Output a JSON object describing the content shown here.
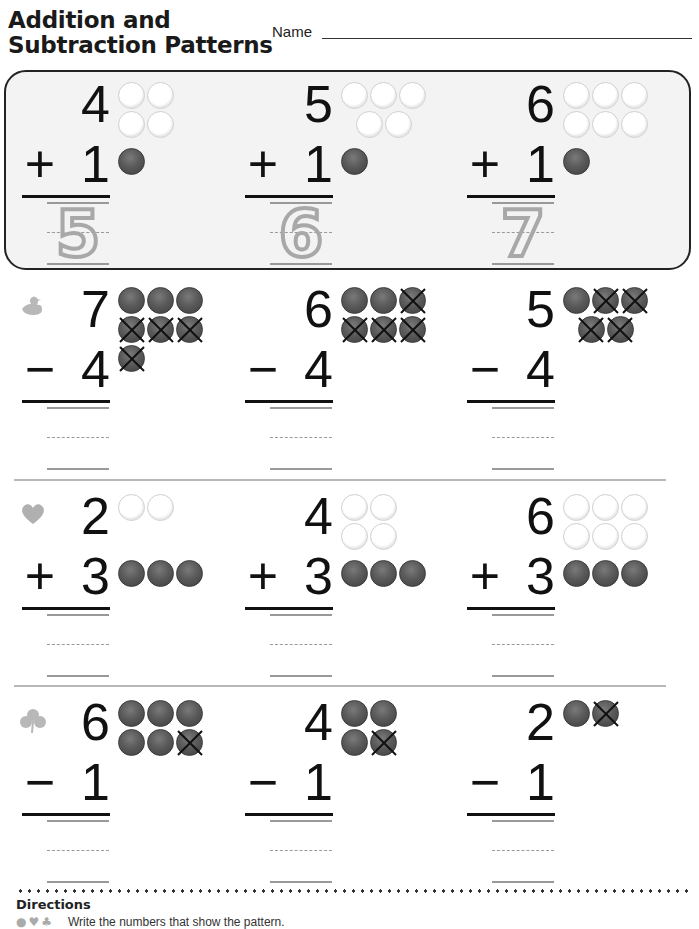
{
  "header": {
    "title_line1": "Addition and",
    "title_line2": "Subtraction Patterns",
    "name_label": "Name"
  },
  "sections": [
    {
      "id": "example",
      "icon": "none",
      "problems": [
        {
          "top": "4",
          "op": "+",
          "bottom": "1",
          "answer": "5",
          "white_counters": 4,
          "red_counters": 1,
          "crossed": 0
        },
        {
          "top": "5",
          "op": "+",
          "bottom": "1",
          "answer": "6",
          "white_counters": 5,
          "red_counters": 1,
          "crossed": 0
        },
        {
          "top": "6",
          "op": "+",
          "bottom": "1",
          "answer": "7",
          "white_counters": 6,
          "red_counters": 1,
          "crossed": 0
        }
      ]
    },
    {
      "id": "duck",
      "icon": "duck-icon",
      "problems": [
        {
          "top": "7",
          "op": "−",
          "bottom": "4",
          "answer": "",
          "red_counters": 7,
          "crossed": 4
        },
        {
          "top": "6",
          "op": "−",
          "bottom": "4",
          "answer": "",
          "red_counters": 6,
          "crossed": 4
        },
        {
          "top": "5",
          "op": "−",
          "bottom": "4",
          "answer": "",
          "red_counters": 5,
          "crossed": 4
        }
      ]
    },
    {
      "id": "heart",
      "icon": "heart-icon",
      "problems": [
        {
          "top": "2",
          "op": "+",
          "bottom": "3",
          "answer": "",
          "white_counters": 2,
          "red_counters": 3
        },
        {
          "top": "4",
          "op": "+",
          "bottom": "3",
          "answer": "",
          "white_counters": 4,
          "red_counters": 3
        },
        {
          "top": "6",
          "op": "+",
          "bottom": "3",
          "answer": "",
          "white_counters": 6,
          "red_counters": 3
        }
      ]
    },
    {
      "id": "clover",
      "icon": "clover-icon",
      "problems": [
        {
          "top": "6",
          "op": "−",
          "bottom": "1",
          "answer": "",
          "red_counters": 6,
          "crossed": 1
        },
        {
          "top": "4",
          "op": "−",
          "bottom": "1",
          "answer": "",
          "red_counters": 4,
          "crossed": 1
        },
        {
          "top": "2",
          "op": "−",
          "bottom": "1",
          "answer": "",
          "red_counters": 2,
          "crossed": 1
        }
      ]
    }
  ],
  "directions": {
    "title": "Directions",
    "text": "Write the numbers that show the pattern."
  },
  "colors": {
    "counter_filled": "#5a5a5a",
    "counter_empty": "#ffffff",
    "traced_digit": "#a8a8a8",
    "panel_bg": "#f3f3f3"
  }
}
